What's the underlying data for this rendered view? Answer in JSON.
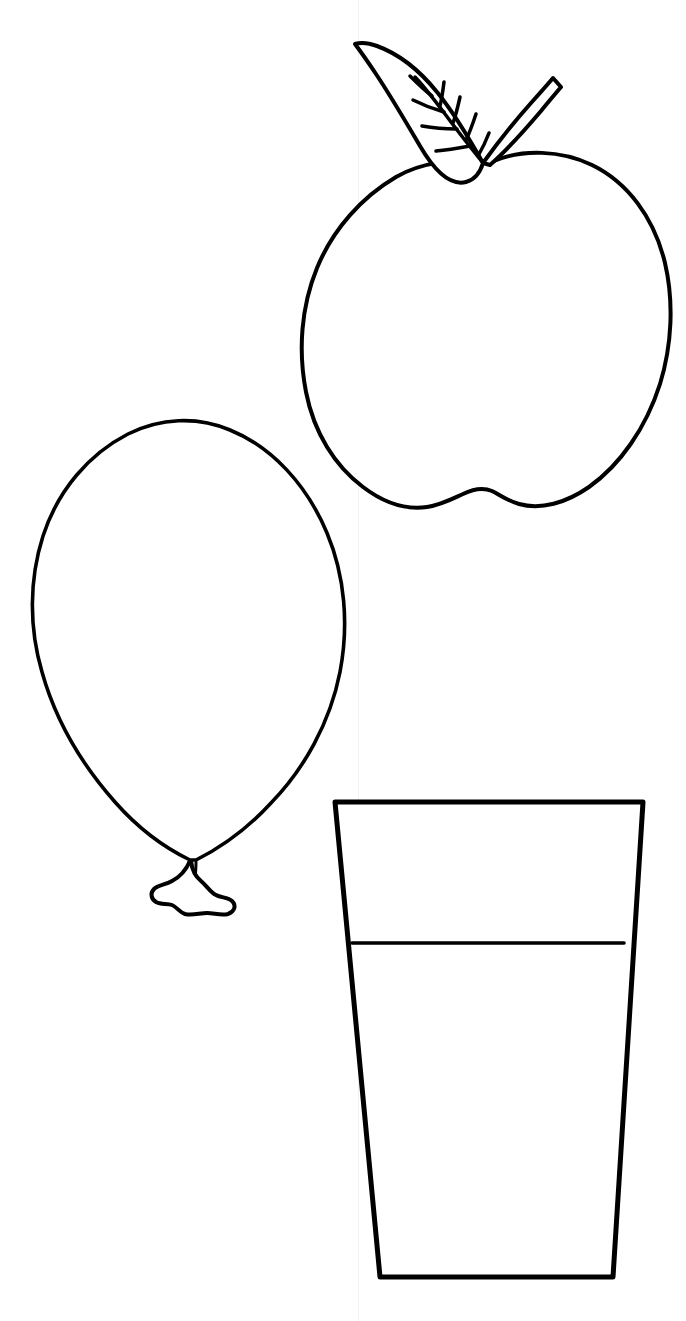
{
  "page": {
    "width": 686,
    "height": 1321,
    "background_color": "#ffffff",
    "ink_color": "#000000",
    "style": "black-and-white line art / coloring book outline",
    "artifact": {
      "name": "vertical-scan-line",
      "x": 358,
      "color": "#f1f1f1",
      "description": "faint vertical seam line running full page height"
    }
  },
  "objects": [
    {
      "id": "apple",
      "label": "Apple",
      "position": "top-right",
      "bbox": [
        300,
        35,
        675,
        512
      ],
      "parts": [
        {
          "name": "apple-body",
          "label": "Apple body",
          "description": "heart-shaped fruit outline with wavy double-lobe bottom"
        },
        {
          "name": "apple-leaf",
          "label": "Leaf",
          "description": "pointed leaf to the upper-left with central midrib and side veins"
        },
        {
          "name": "apple-leaf-veins",
          "label": "Leaf veins",
          "vein_pairs": 6
        },
        {
          "name": "apple-stem",
          "label": "Stem",
          "description": "short tapered stem angled up and to the right"
        }
      ],
      "stroke_width": 4
    },
    {
      "id": "balloon",
      "label": "Balloon",
      "position": "middle-left",
      "bbox": [
        30,
        418,
        350,
        915
      ],
      "parts": [
        {
          "name": "balloon-body",
          "label": "Balloon body",
          "description": "large egg-shaped oval tapering to a point at the bottom"
        },
        {
          "name": "balloon-neck",
          "label": "Balloon neck",
          "description": "narrow pinched neck with two crease lines"
        },
        {
          "name": "balloon-knot",
          "label": "Balloon knot",
          "description": "wavy tied knot flaring out like a small bow"
        }
      ],
      "stroke_width": 4
    },
    {
      "id": "glass",
      "label": "Glass of water",
      "position": "bottom-right",
      "bbox": [
        333,
        800,
        645,
        1280
      ],
      "parts": [
        {
          "name": "glass-body",
          "label": "Glass body",
          "description": "tall tapered tumbler, wider at the rim than the base"
        },
        {
          "name": "glass-water-line",
          "label": "Water line",
          "description": "horizontal line across the glass marking the liquid level",
          "y": 943
        },
        {
          "name": "glass-base",
          "label": "Glass base",
          "description": "flat bottom edge"
        }
      ],
      "stroke_width": 5
    }
  ]
}
